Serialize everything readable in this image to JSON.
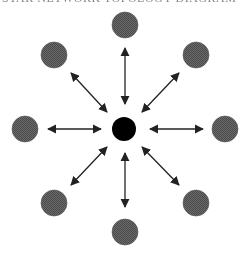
{
  "diagram": {
    "title_fragment": "STAR NETWORK TOPOLOGY DIAGRAM",
    "type": "hub-and-spoke",
    "hub": {
      "cx": 124,
      "cy": 129,
      "r": 12,
      "fill": "#000000"
    },
    "nodes": [
      {
        "id": "top",
        "cx": 125,
        "cy": 25,
        "r": 13,
        "fill": "#5a5a5a"
      },
      {
        "id": "top-right",
        "cx": 196,
        "cy": 55,
        "r": 13,
        "fill": "#5a5a5a"
      },
      {
        "id": "right",
        "cx": 225,
        "cy": 129,
        "r": 13,
        "fill": "#5a5a5a"
      },
      {
        "id": "bottom-right",
        "cx": 196,
        "cy": 203,
        "r": 13,
        "fill": "#5a5a5a"
      },
      {
        "id": "bottom",
        "cx": 125,
        "cy": 232,
        "r": 13,
        "fill": "#5a5a5a"
      },
      {
        "id": "bottom-left",
        "cx": 54,
        "cy": 203,
        "r": 13,
        "fill": "#5a5a5a"
      },
      {
        "id": "left",
        "cx": 25,
        "cy": 129,
        "r": 13,
        "fill": "#5a5a5a"
      },
      {
        "id": "top-left",
        "cx": 54,
        "cy": 55,
        "r": 13,
        "fill": "#5a5a5a"
      }
    ],
    "arrows": [
      {
        "id": "top",
        "x1": 125,
        "y1": 48,
        "x2": 125,
        "y2": 104
      },
      {
        "id": "top-right",
        "x1": 179,
        "y1": 73,
        "x2": 142,
        "y2": 112
      },
      {
        "id": "right",
        "x1": 203,
        "y1": 129,
        "x2": 150,
        "y2": 129
      },
      {
        "id": "bottom-right",
        "x1": 179,
        "y1": 185,
        "x2": 142,
        "y2": 147
      },
      {
        "id": "bottom",
        "x1": 125,
        "y1": 207,
        "x2": 125,
        "y2": 153
      },
      {
        "id": "bottom-left",
        "x1": 71,
        "y1": 185,
        "x2": 107,
        "y2": 147
      },
      {
        "id": "left",
        "x1": 48,
        "y1": 129,
        "x2": 101,
        "y2": 129
      },
      {
        "id": "top-left",
        "x1": 71,
        "y1": 73,
        "x2": 107,
        "y2": 112
      }
    ],
    "arrow_style": "bidirectional",
    "arrow_color": "#222222"
  }
}
